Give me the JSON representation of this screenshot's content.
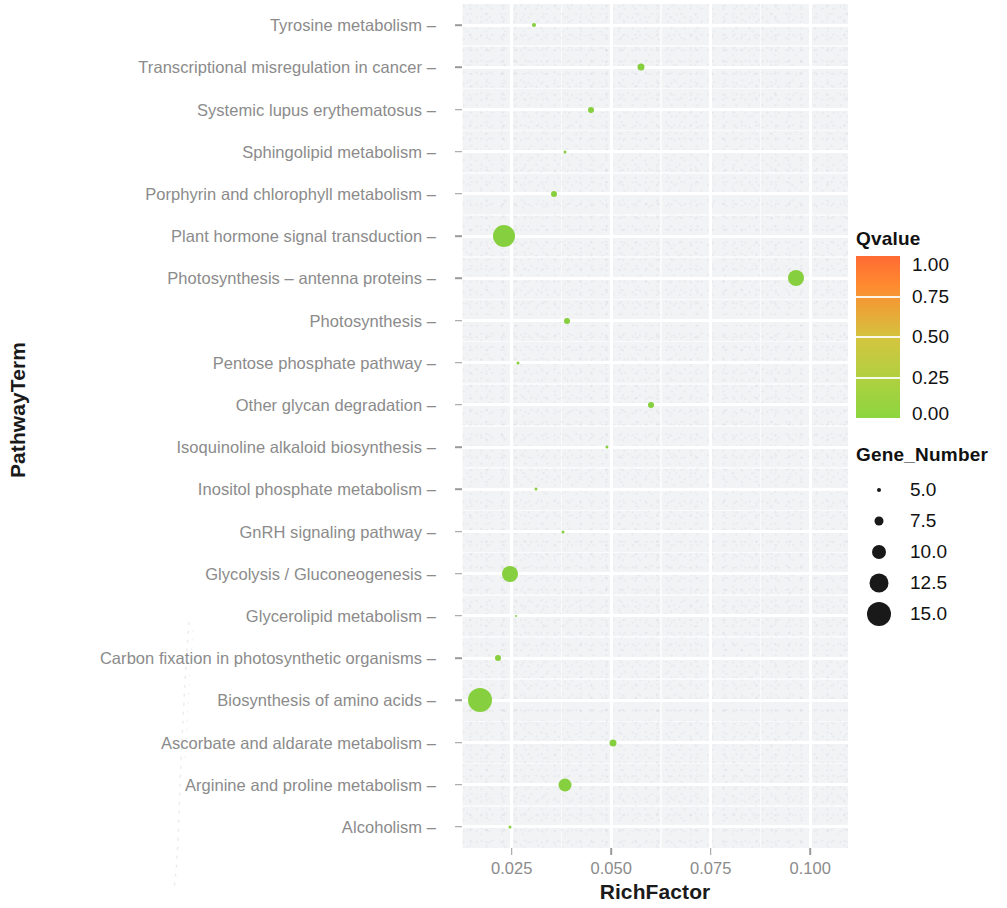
{
  "chart_data": {
    "type": "scatter",
    "subtype": "bubble",
    "title": "",
    "xlabel": "RichFactor",
    "ylabel": "PathwayTerm",
    "xlim": [
      0.0125,
      0.1095
    ],
    "x_ticks": [
      0.025,
      0.05,
      0.075,
      0.1
    ],
    "x_tick_labels": [
      "0.025",
      "0.050",
      "0.075",
      "0.100"
    ],
    "grid": true,
    "grid_color": "#ffffff",
    "panel_background": "#f2f3f5",
    "categories": [
      "Tyrosine metabolism",
      "Transcriptional misregulation in cancer",
      "Systemic lupus erythematosus",
      "Sphingolipid metabolism",
      "Porphyrin and chlorophyll metabolism",
      "Plant hormone signal transduction",
      "Photosynthesis – antenna proteins",
      "Photosynthesis",
      "Pentose phosphate pathway",
      "Other glycan degradation",
      "Isoquinoline alkaloid biosynthesis",
      "Inositol phosphate metabolism",
      "GnRH signaling pathway",
      "Glycolysis / Gluconeogenesis",
      "Glycerolipid metabolism",
      "Carbon fixation in photosynthetic organisms",
      "Biosynthesis of amino acids",
      "Ascorbate and aldarate metabolism",
      "Arginine and proline metabolism",
      "Alcoholism"
    ],
    "points": [
      {
        "pathway": "Tyrosine metabolism",
        "rich_factor": 0.0305,
        "gene_number": 5.0,
        "qvalue": 0.07,
        "color": "#86CF3E"
      },
      {
        "pathway": "Transcriptional misregulation in cancer",
        "rich_factor": 0.0575,
        "gene_number": 6.5,
        "qvalue": 0.07,
        "color": "#86CF3E"
      },
      {
        "pathway": "Systemic lupus erythematosus",
        "rich_factor": 0.045,
        "gene_number": 6.0,
        "qvalue": 0.07,
        "color": "#86CF3E"
      },
      {
        "pathway": "Sphingolipid metabolism",
        "rich_factor": 0.0385,
        "gene_number": 4.5,
        "qvalue": 0.07,
        "color": "#86CF3E"
      },
      {
        "pathway": "Porphyrin and chlorophyll metabolism",
        "rich_factor": 0.0355,
        "gene_number": 6.0,
        "qvalue": 0.07,
        "color": "#86CF3E"
      },
      {
        "pathway": "Plant hormone signal transduction",
        "rich_factor": 0.023,
        "gene_number": 14.0,
        "qvalue": 0.05,
        "color": "#86CF3E"
      },
      {
        "pathway": "Photosynthesis – antenna proteins",
        "rich_factor": 0.0965,
        "gene_number": 11.0,
        "qvalue": 0.03,
        "color": "#86CF3E"
      },
      {
        "pathway": "Photosynthesis",
        "rich_factor": 0.039,
        "gene_number": 6.0,
        "qvalue": 0.07,
        "color": "#86CF3E"
      },
      {
        "pathway": "Pentose phosphate pathway",
        "rich_factor": 0.0265,
        "gene_number": 4.5,
        "qvalue": 0.07,
        "color": "#86CF3E"
      },
      {
        "pathway": "Other glycan degradation",
        "rich_factor": 0.06,
        "gene_number": 6.0,
        "qvalue": 0.07,
        "color": "#86CF3E"
      },
      {
        "pathway": "Isoquinoline alkaloid biosynthesis",
        "rich_factor": 0.049,
        "gene_number": 4.5,
        "qvalue": 0.07,
        "color": "#86CF3E"
      },
      {
        "pathway": "Inositol phosphate metabolism",
        "rich_factor": 0.031,
        "gene_number": 4.5,
        "qvalue": 0.07,
        "color": "#86CF3E"
      },
      {
        "pathway": "GnRH signaling pathway",
        "rich_factor": 0.038,
        "gene_number": 4.5,
        "qvalue": 0.07,
        "color": "#86CF3E"
      },
      {
        "pathway": "Glycolysis / Gluconeogenesis",
        "rich_factor": 0.0245,
        "gene_number": 11.0,
        "qvalue": 0.05,
        "color": "#86CF3E"
      },
      {
        "pathway": "Glycerolipid metabolism",
        "rich_factor": 0.026,
        "gene_number": 4.0,
        "qvalue": 0.07,
        "color": "#86CF3E"
      },
      {
        "pathway": "Carbon fixation in photosynthetic organisms",
        "rich_factor": 0.0215,
        "gene_number": 6.0,
        "qvalue": 0.07,
        "color": "#86CF3E"
      },
      {
        "pathway": "Biosynthesis of amino acids",
        "rich_factor": 0.017,
        "gene_number": 15.0,
        "qvalue": 0.03,
        "color": "#86CF3E"
      },
      {
        "pathway": "Ascorbate and aldarate metabolism",
        "rich_factor": 0.0505,
        "gene_number": 6.5,
        "qvalue": 0.07,
        "color": "#86CF3E"
      },
      {
        "pathway": "Arginine and proline metabolism",
        "rich_factor": 0.0385,
        "gene_number": 9.5,
        "qvalue": 0.06,
        "color": "#86CF3E"
      },
      {
        "pathway": "Alcoholism",
        "rich_factor": 0.0245,
        "gene_number": 4.5,
        "qvalue": 0.07,
        "color": "#86CF3E"
      }
    ],
    "legends": {
      "color": {
        "title": "Qvalue",
        "ticks": [
          1.0,
          0.75,
          0.5,
          0.25,
          0.0
        ],
        "tick_labels": [
          "1.00",
          "0.75",
          "0.50",
          "0.25",
          "0.00"
        ],
        "range": [
          0.0,
          1.0
        ],
        "gradient_top_color": "#FF6A33",
        "gradient_mid_color": "#D2C63F",
        "gradient_bottom_color": "#8CD63F"
      },
      "size": {
        "title": "Gene_Number",
        "values": [
          5.0,
          7.5,
          10.0,
          12.5,
          15.0
        ],
        "value_labels": [
          "5.0",
          "7.5",
          "10.0",
          "12.5",
          "15.0"
        ],
        "dot_radii_px": [
          2.0,
          4.5,
          7.0,
          9.5,
          12.0
        ],
        "dot_color": "#191919"
      }
    }
  }
}
